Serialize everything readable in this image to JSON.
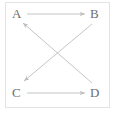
{
  "diagram": {
    "frame": {
      "visible": true,
      "color": "#e3e3e3"
    },
    "edge_color": "#bdbdbd",
    "label_color": "#6e6e6e",
    "nodes": [
      {
        "id": "A",
        "label": "A",
        "position": "top-left"
      },
      {
        "id": "B",
        "label": "B",
        "position": "top-right"
      },
      {
        "id": "C",
        "label": "C",
        "position": "bottom-left"
      },
      {
        "id": "D",
        "label": "D",
        "position": "bottom-right"
      }
    ],
    "edges": [
      {
        "id": "a-to-b",
        "from": "A",
        "to": "B",
        "kind": "horizontal-top",
        "directed": true
      },
      {
        "id": "c-to-d",
        "from": "C",
        "to": "D",
        "kind": "horizontal-bottom",
        "directed": true
      },
      {
        "id": "b-to-c",
        "from": "B",
        "to": "C",
        "kind": "diagonal-down-left",
        "directed": true
      },
      {
        "id": "d-to-a",
        "from": "D",
        "to": "A",
        "kind": "diagonal-up-left",
        "directed": true
      }
    ]
  }
}
